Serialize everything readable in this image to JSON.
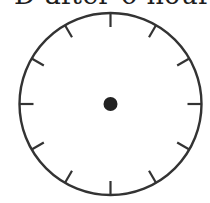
{
  "caption": {
    "text": "D after 6 hours"
  },
  "clock": {
    "center": [
      110.5,
      104
    ],
    "radius": 91,
    "tick_count": 12,
    "tick_length": 14,
    "stroke_color": "#333333",
    "dot_color": "#222222",
    "dot_radius": 7,
    "hands": []
  }
}
